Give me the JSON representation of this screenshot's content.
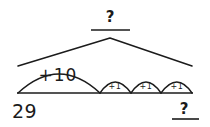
{
  "diagram": {
    "kind": "open-number-line-jump-strategy",
    "start_value": "29",
    "total_label": "?",
    "end_label": "?",
    "jumps": [
      {
        "label": "+10",
        "size": "large"
      },
      {
        "label": "+1",
        "size": "small"
      },
      {
        "label": "+1",
        "size": "small"
      },
      {
        "label": "+1",
        "size": "small"
      }
    ],
    "colors": {
      "ink": "#1b1b1b",
      "paper": "#ffffff"
    }
  }
}
